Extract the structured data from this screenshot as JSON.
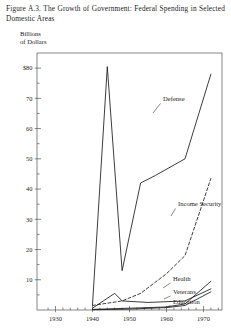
{
  "caption": "Figure A.3. The Growth of Government: Federal Spending in Selected Domestic Areas",
  "axis_label": {
    "line1": "Billions",
    "line2": "of Dollars"
  },
  "chart_data": {
    "type": "line",
    "title": "Figure A.3. The Growth of Government: Federal Spending in Selected Domestic Areas",
    "xlabel": "",
    "ylabel": "Billions of Dollars",
    "xlim": [
      1925,
      1975
    ],
    "ylim": [
      0,
      85
    ],
    "grid": false,
    "legend_position": "inline-right",
    "xticks": [
      1930,
      1940,
      1950,
      1960,
      1970
    ],
    "xtick_labels": [
      "1930",
      "1940",
      "1950",
      "1960",
      "1970"
    ],
    "xminor_step": 2,
    "yticks": [
      10,
      20,
      30,
      40,
      50,
      60,
      70,
      80
    ],
    "ytick_labels": [
      "10",
      "20",
      "30",
      "40",
      "50",
      "60",
      "70",
      "$80"
    ],
    "yminor_step": 5,
    "series": [
      {
        "name": "Defense",
        "style": "solid",
        "color": "#1a1a1a",
        "x": [
          1940,
          1944,
          1948,
          1953,
          1957,
          1965,
          1972
        ],
        "values": [
          1.7,
          80.5,
          13.0,
          42.0,
          44.5,
          50.0,
          78.0
        ]
      },
      {
        "name": "Income Security",
        "style": "dashed",
        "color": "#1a1a1a",
        "x": [
          1940,
          1948,
          1953,
          1960,
          1965,
          1972
        ],
        "values": [
          1.5,
          3.0,
          5.5,
          12.0,
          18.0,
          43.5
        ]
      },
      {
        "name": "Health",
        "style": "solid",
        "color": "#1a1a1a",
        "x": [
          1940,
          1950,
          1960,
          1965,
          1972
        ],
        "values": [
          0.2,
          0.6,
          1.0,
          2.0,
          9.5
        ]
      },
      {
        "name": "Veterans",
        "style": "solid",
        "color": "#1a1a1a",
        "x": [
          1940,
          1946,
          1948,
          1955,
          1965,
          1972
        ],
        "values": [
          0.6,
          5.5,
          3.0,
          2.5,
          3.0,
          7.0
        ]
      },
      {
        "name": "Education",
        "style": "solid",
        "color": "#1a1a1a",
        "x": [
          1940,
          1950,
          1960,
          1965,
          1972
        ],
        "values": [
          0.1,
          0.3,
          0.8,
          1.5,
          6.0
        ]
      }
    ]
  }
}
